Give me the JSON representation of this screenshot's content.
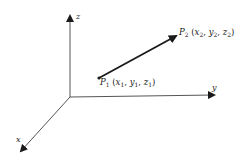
{
  "diagram": {
    "type": "3d-coordinate-vector",
    "axes": [
      {
        "name": "x",
        "label": "x"
      },
      {
        "name": "y",
        "label": "y"
      },
      {
        "name": "z",
        "label": "z"
      }
    ],
    "points": [
      {
        "name": "P1",
        "label": "P",
        "subscript": "1",
        "coords": [
          "x",
          "y",
          "z"
        ],
        "coord_subscript": "1"
      },
      {
        "name": "P2",
        "label": "P",
        "subscript": "2",
        "coords": [
          "x",
          "y",
          "z"
        ],
        "coord_subscript": "2"
      }
    ],
    "vector": {
      "from": "P1",
      "to": "P2"
    },
    "colors": {
      "line": "#1a1a1a",
      "axis": "#555555",
      "background": "#ffffff"
    }
  }
}
